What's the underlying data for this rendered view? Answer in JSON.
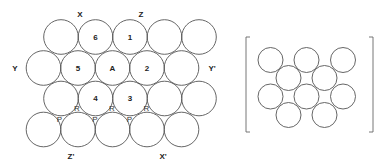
{
  "left_diagram": {
    "radius": 17.3,
    "circles": [
      {
        "x": 61,
        "y": 37,
        "label": ""
      },
      {
        "x": 95.5,
        "y": 37,
        "label": "6"
      },
      {
        "x": 130,
        "y": 37,
        "label": "1"
      },
      {
        "x": 164.5,
        "y": 37,
        "label": ""
      },
      {
        "x": 199,
        "y": 37,
        "label": ""
      },
      {
        "x": 43.5,
        "y": 68,
        "label": ""
      },
      {
        "x": 78,
        "y": 68,
        "label": "5"
      },
      {
        "x": 112.5,
        "y": 68,
        "label": "A"
      },
      {
        "x": 147,
        "y": 68,
        "label": "2"
      },
      {
        "x": 181.5,
        "y": 68,
        "label": ""
      },
      {
        "x": 61,
        "y": 98.5,
        "label": ""
      },
      {
        "x": 95.5,
        "y": 98.5,
        "label": "4"
      },
      {
        "x": 130,
        "y": 98.5,
        "label": "3"
      },
      {
        "x": 164.5,
        "y": 98.5,
        "label": ""
      },
      {
        "x": 199,
        "y": 98.5,
        "label": ""
      },
      {
        "x": 43.5,
        "y": 129.5,
        "label": ""
      },
      {
        "x": 78,
        "y": 129.5,
        "label": ""
      },
      {
        "x": 112.5,
        "y": 129.5,
        "label": ""
      },
      {
        "x": 147,
        "y": 129.5,
        "label": ""
      },
      {
        "x": 181.5,
        "y": 129.5,
        "label": ""
      }
    ],
    "axis_labels": [
      {
        "text": "X",
        "x": 80,
        "y": 14
      },
      {
        "text": "Z",
        "x": 141,
        "y": 14
      },
      {
        "text": "Y",
        "x": 15,
        "y": 68
      },
      {
        "text": "Y'",
        "x": 212,
        "y": 68
      },
      {
        "text": "Z'",
        "x": 71,
        "y": 156
      },
      {
        "text": "X'",
        "x": 163,
        "y": 156
      }
    ],
    "point_labels": [
      {
        "text": "R",
        "x": 77,
        "y": 108
      },
      {
        "text": "R",
        "x": 112,
        "y": 108
      },
      {
        "text": "R",
        "x": 146.5,
        "y": 108
      },
      {
        "text": "P",
        "x": 59.5,
        "y": 119
      },
      {
        "text": "P",
        "x": 95,
        "y": 119
      },
      {
        "text": "P",
        "x": 129.5,
        "y": 119
      }
    ]
  },
  "right_diagram": {
    "radius": 12.5,
    "circles": [
      {
        "x": 270.5,
        "y": 60
      },
      {
        "x": 306.5,
        "y": 60
      },
      {
        "x": 343,
        "y": 60
      },
      {
        "x": 288.5,
        "y": 78
      },
      {
        "x": 324.5,
        "y": 78
      },
      {
        "x": 270.5,
        "y": 96.5
      },
      {
        "x": 306.5,
        "y": 96.5
      },
      {
        "x": 343,
        "y": 96.5
      },
      {
        "x": 288.5,
        "y": 115
      },
      {
        "x": 324.5,
        "y": 115
      }
    ],
    "bracket": {
      "left_x": 246,
      "right_x": 373,
      "top_y": 37,
      "bottom_y": 132,
      "tick": 4
    }
  }
}
